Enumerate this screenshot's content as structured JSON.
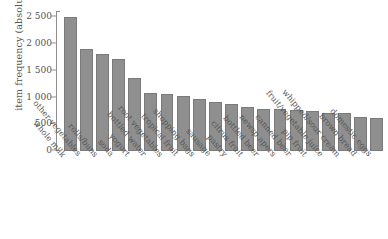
{
  "chart_data": {
    "type": "bar",
    "title": "",
    "xlabel": "",
    "ylabel": "item frequency (absolute)",
    "ylim": [
      0,
      2600
    ],
    "grid": false,
    "legend": null,
    "orientation": "vertical",
    "bar_color": "#8f8f8f",
    "bar_border_color": "#7a7a7a",
    "axis_color": "#8d8d8d",
    "text_color": "#555555",
    "ytick_labels": [
      "0",
      "500",
      "1 000",
      "1 500",
      "2 000",
      "2 500"
    ],
    "ytick_values": [
      0,
      500,
      1000,
      1500,
      2000,
      2500
    ],
    "categories": [
      "whole milk",
      "other vegetables",
      "rolls/buns",
      "soda",
      "yogurt",
      "bottled water",
      "root vegetables",
      "tropical fruit",
      "shopping bags",
      "sausage",
      "pastry",
      "citrus fruit",
      "bottled beer",
      "newsp apers",
      "canned beer",
      "pip fruit",
      "fruit/vegetable juice",
      "whipped/sour cream",
      "brown bread",
      "domestic eggs"
    ],
    "values": [
      2513,
      1903,
      1809,
      1715,
      1372,
      1087,
      1072,
      1032,
      969,
      924,
      875,
      814,
      792,
      785,
      764,
      744,
      711,
      705,
      638,
      624
    ]
  },
  "caption": ""
}
